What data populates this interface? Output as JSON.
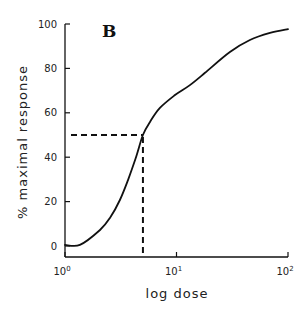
{
  "chart_data": {
    "type": "line",
    "panel_label": "B",
    "title": "",
    "xlabel": "log dose",
    "ylabel": "% maximal response",
    "xscale": "log",
    "xlim": [
      1,
      100
    ],
    "ylim": [
      0,
      100
    ],
    "x_ticks": [
      {
        "value": 1,
        "base": "10",
        "exp": "0"
      },
      {
        "value": 10,
        "base": "10",
        "exp": "1"
      },
      {
        "value": 100,
        "base": "10",
        "exp": "2"
      }
    ],
    "y_ticks": [
      0,
      20,
      40,
      60,
      80,
      100
    ],
    "grid": false,
    "legend": null,
    "series": [
      {
        "name": "dose-response",
        "style": "solid",
        "x": [
          1.0,
          1.36,
          2.06,
          2.53,
          3.11,
          3.67,
          4.33,
          5.0,
          5.78,
          7.1,
          9.7,
          13.2,
          18.0,
          30.1,
          45.5,
          69.0,
          100.0
        ],
        "y": [
          0.5,
          0.5,
          7.2,
          12.6,
          20.7,
          29.7,
          40.0,
          50.0,
          55.9,
          62.2,
          68.0,
          72.5,
          78.0,
          87.4,
          92.8,
          96.0,
          97.7
        ]
      }
    ],
    "annotations": [
      {
        "type": "dashed-hline",
        "y": 50,
        "x_from": 1,
        "x_to": 5.0,
        "label": "50% response"
      },
      {
        "type": "dashed-vline",
        "x": 5.0,
        "y_from": 0,
        "y_to": 50,
        "label": "EC50"
      }
    ]
  }
}
